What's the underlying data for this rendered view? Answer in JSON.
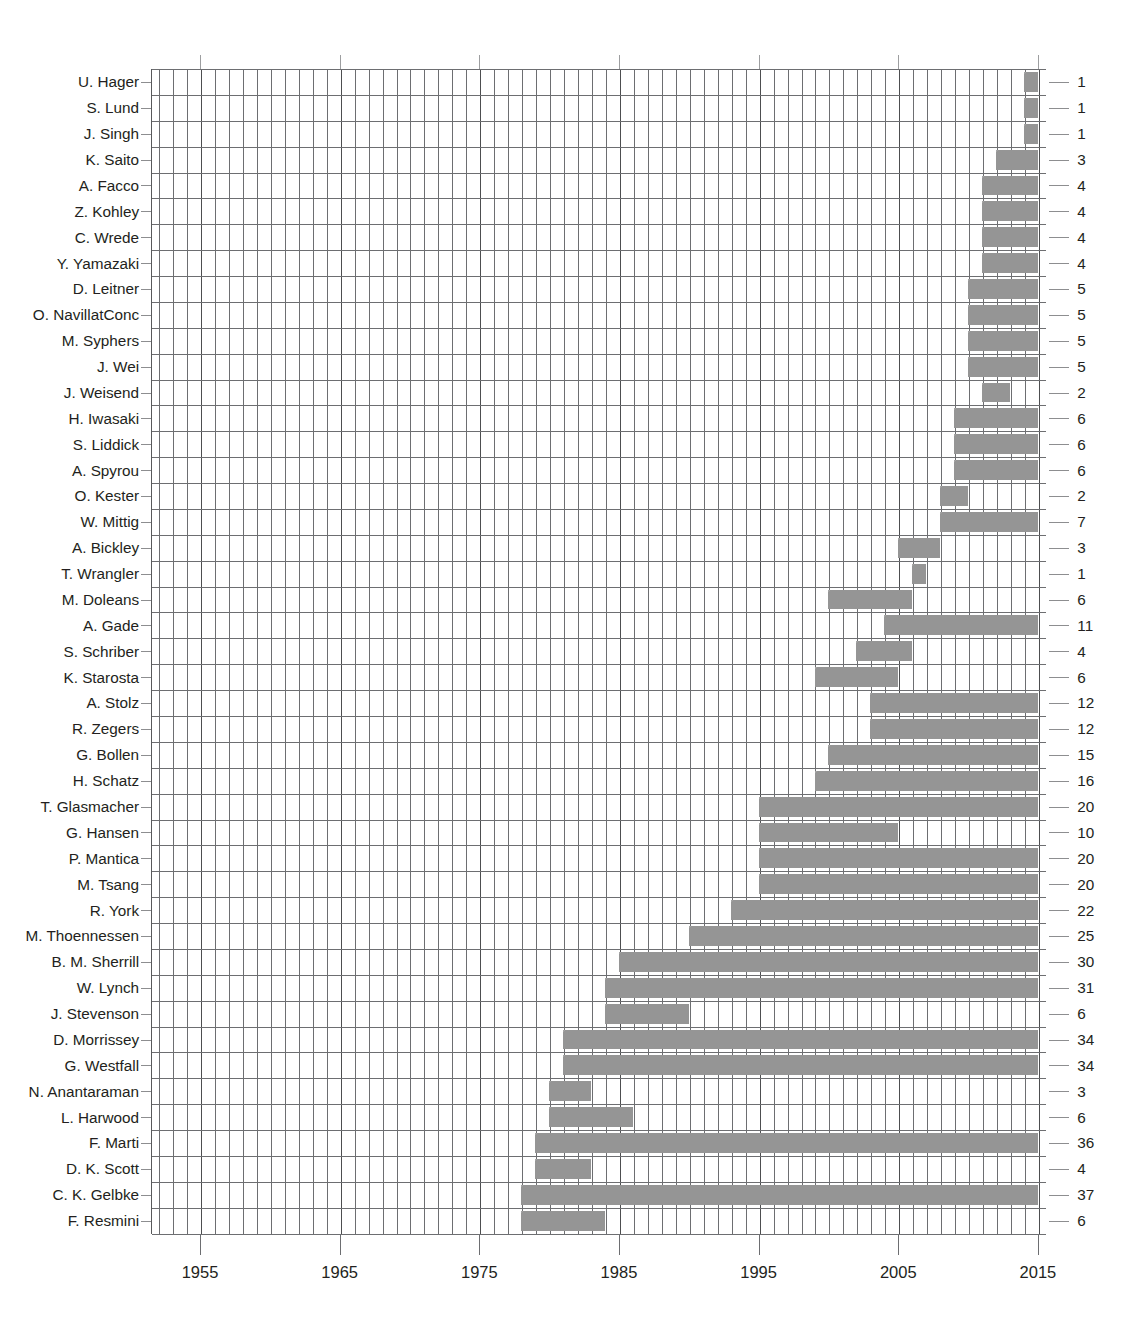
{
  "figure": {
    "kind": "gantt-timeline-bar-chart",
    "background": "#ffffff",
    "bar_color": "#9a9a9a",
    "grid_color": "#6d6e71",
    "text_color": "#231f20"
  },
  "chart_data": {
    "type": "bar",
    "orientation": "horizontal",
    "title": "",
    "subtitle": "",
    "xlabel": "",
    "ylabel": "",
    "xlim": [
      1951,
      2016
    ],
    "xticks": [
      1955,
      1965,
      1975,
      1985,
      1995,
      2005,
      2015
    ],
    "xtick_labels": [
      "1955",
      "1965",
      "1975",
      "1985",
      "1995",
      "2005",
      "2015"
    ],
    "minor_gridline_step_years": 1,
    "grid": true,
    "legend": null,
    "value_label_position": "right-of-axis",
    "value_label_meaning": "bar length in years",
    "categories": [
      "U. Hager",
      "S. Lund",
      "J. Singh",
      "K. Saito",
      "A. Facco",
      "Z. Kohley",
      "C. Wrede",
      "Y. Yamazaki",
      "D. Leitner",
      "O. NavillatConc",
      "M. Syphers",
      "J. Wei",
      "J. Weisend",
      "H. Iwasaki",
      "S. Liddick",
      "A. Spyrou",
      "O. Kester",
      "W. Mittig",
      "A. Bickley",
      "T. Wrangler",
      "M. Doleans",
      "A. Gade",
      "S. Schriber",
      "K. Starosta",
      "A. Stolz",
      "R. Zegers",
      "G. Bollen",
      "H. Schatz",
      "T. Glasmacher",
      "G. Hansen",
      "P. Mantica",
      "M. Tsang",
      "R. York",
      "M. Thoennessen",
      "B. M. Sherrill",
      "W. Lynch",
      "J. Stevenson",
      "D. Morrissey",
      "G. Westfall",
      "N. Anantaraman",
      "L. Harwood",
      "F. Marti",
      "D. K. Scott",
      "C. K. Gelbke",
      "F. Resmini"
    ],
    "values": [
      1,
      1,
      1,
      3,
      4,
      4,
      4,
      4,
      5,
      5,
      5,
      5,
      2,
      6,
      6,
      6,
      2,
      7,
      3,
      1,
      6,
      11,
      4,
      6,
      12,
      12,
      15,
      16,
      20,
      10,
      20,
      20,
      22,
      25,
      30,
      31,
      6,
      34,
      34,
      3,
      6,
      36,
      4,
      37,
      6
    ],
    "bars": [
      {
        "label": "U. Hager",
        "start": 2014,
        "end": 2015,
        "value": 1
      },
      {
        "label": "S. Lund",
        "start": 2014,
        "end": 2015,
        "value": 1
      },
      {
        "label": "J. Singh",
        "start": 2014,
        "end": 2015,
        "value": 1
      },
      {
        "label": "K. Saito",
        "start": 2012,
        "end": 2015,
        "value": 3
      },
      {
        "label": "A. Facco",
        "start": 2011,
        "end": 2015,
        "value": 4
      },
      {
        "label": "Z. Kohley",
        "start": 2011,
        "end": 2015,
        "value": 4
      },
      {
        "label": "C. Wrede",
        "start": 2011,
        "end": 2015,
        "value": 4
      },
      {
        "label": "Y. Yamazaki",
        "start": 2011,
        "end": 2015,
        "value": 4
      },
      {
        "label": "D. Leitner",
        "start": 2010,
        "end": 2015,
        "value": 5
      },
      {
        "label": "O. NavillatConc",
        "start": 2010,
        "end": 2015,
        "value": 5
      },
      {
        "label": "M. Syphers",
        "start": 2010,
        "end": 2015,
        "value": 5
      },
      {
        "label": "J. Wei",
        "start": 2010,
        "end": 2015,
        "value": 5
      },
      {
        "label": "J. Weisend",
        "start": 2011,
        "end": 2013,
        "value": 2
      },
      {
        "label": "H. Iwasaki",
        "start": 2009,
        "end": 2015,
        "value": 6
      },
      {
        "label": "S. Liddick",
        "start": 2009,
        "end": 2015,
        "value": 6
      },
      {
        "label": "A. Spyrou",
        "start": 2009,
        "end": 2015,
        "value": 6
      },
      {
        "label": "O. Kester",
        "start": 2008,
        "end": 2010,
        "value": 2
      },
      {
        "label": "W. Mittig",
        "start": 2008,
        "end": 2015,
        "value": 7
      },
      {
        "label": "A. Bickley",
        "start": 2005,
        "end": 2008,
        "value": 3
      },
      {
        "label": "T. Wrangler",
        "start": 2006,
        "end": 2007,
        "value": 1
      },
      {
        "label": "M. Doleans",
        "start": 2000,
        "end": 2006,
        "value": 6
      },
      {
        "label": "A. Gade",
        "start": 2004,
        "end": 2015,
        "value": 11
      },
      {
        "label": "S. Schriber",
        "start": 2002,
        "end": 2006,
        "value": 4
      },
      {
        "label": "K. Starosta",
        "start": 1999,
        "end": 2005,
        "value": 6
      },
      {
        "label": "A. Stolz",
        "start": 2003,
        "end": 2015,
        "value": 12
      },
      {
        "label": "R. Zegers",
        "start": 2003,
        "end": 2015,
        "value": 12
      },
      {
        "label": "G. Bollen",
        "start": 2000,
        "end": 2015,
        "value": 15
      },
      {
        "label": "H. Schatz",
        "start": 1999,
        "end": 2015,
        "value": 16
      },
      {
        "label": "T. Glasmacher",
        "start": 1995,
        "end": 2015,
        "value": 20
      },
      {
        "label": "G. Hansen",
        "start": 1995,
        "end": 2005,
        "value": 10
      },
      {
        "label": "P. Mantica",
        "start": 1995,
        "end": 2015,
        "value": 20
      },
      {
        "label": "M. Tsang",
        "start": 1995,
        "end": 2015,
        "value": 20
      },
      {
        "label": "R. York",
        "start": 1993,
        "end": 2015,
        "value": 22
      },
      {
        "label": "M. Thoennessen",
        "start": 1990,
        "end": 2015,
        "value": 25
      },
      {
        "label": "B. M. Sherrill",
        "start": 1985,
        "end": 2015,
        "value": 30
      },
      {
        "label": "W. Lynch",
        "start": 1984,
        "end": 2015,
        "value": 31
      },
      {
        "label": "J. Stevenson",
        "start": 1984,
        "end": 1990,
        "value": 6
      },
      {
        "label": "D. Morrissey",
        "start": 1981,
        "end": 2015,
        "value": 34
      },
      {
        "label": "G. Westfall",
        "start": 1981,
        "end": 2015,
        "value": 34
      },
      {
        "label": "N. Anantaraman",
        "start": 1980,
        "end": 1983,
        "value": 3
      },
      {
        "label": "L. Harwood",
        "start": 1980,
        "end": 1986,
        "value": 6
      },
      {
        "label": "F. Marti",
        "start": 1979,
        "end": 2015,
        "value": 36
      },
      {
        "label": "D. K. Scott",
        "start": 1979,
        "end": 1983,
        "value": 4
      },
      {
        "label": "C. K. Gelbke",
        "start": 1978,
        "end": 2015,
        "value": 37
      },
      {
        "label": "F. Resmini",
        "start": 1978,
        "end": 1984,
        "value": 6
      }
    ]
  }
}
